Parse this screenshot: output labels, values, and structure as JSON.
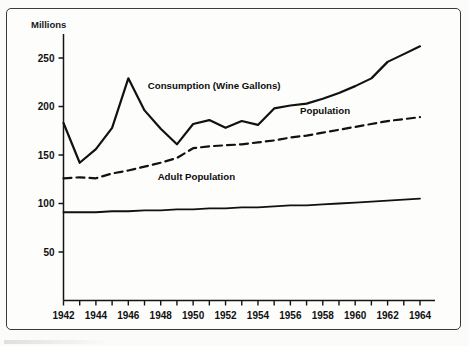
{
  "figure": {
    "frame": true,
    "background_color": "#fdfdfc",
    "ink_color": "#111111"
  },
  "chart_data": {
    "type": "line",
    "title": "",
    "xlabel": "",
    "ylabel": "Millions",
    "ylim": [
      0,
      275
    ],
    "xlim": [
      1942,
      1964
    ],
    "grid": false,
    "legend": "inline-annotations",
    "ytick_labels": [
      "250",
      "200",
      "150",
      "100",
      "50"
    ],
    "ytick_values": [
      250,
      200,
      150,
      100,
      50
    ],
    "xtick_labels": [
      "1942",
      "1944",
      "1946",
      "1948",
      "1950",
      "1952",
      "1954",
      "1956",
      "1958",
      "1960",
      "1962",
      "1964"
    ],
    "xtick_values": [
      1942,
      1944,
      1946,
      1948,
      1950,
      1952,
      1954,
      1956,
      1958,
      1960,
      1962,
      1964
    ],
    "minor_xticks_every": 1,
    "x": [
      1942,
      1943,
      1944,
      1945,
      1946,
      1947,
      1948,
      1949,
      1950,
      1951,
      1952,
      1953,
      1954,
      1955,
      1956,
      1957,
      1958,
      1959,
      1960,
      1961,
      1962,
      1963,
      1964
    ],
    "series": [
      {
        "name": "Consumption (Wine Gallons)",
        "style": "solid",
        "width": 2.2,
        "values": [
          183,
          142,
          156,
          178,
          229,
          196,
          177,
          161,
          182,
          186,
          178,
          185,
          181,
          198,
          201,
          203,
          208,
          214,
          221,
          229,
          246,
          254,
          262
        ]
      },
      {
        "name": "Population",
        "style": "dashed",
        "width": 2.2,
        "values": [
          126,
          127,
          126,
          131,
          134,
          138,
          142,
          147,
          157,
          159,
          160,
          161,
          163,
          165,
          168,
          170,
          173,
          176,
          179,
          182,
          185,
          187,
          189
        ]
      },
      {
        "name": "Adult Population",
        "style": "solid",
        "width": 1.8,
        "values": [
          91,
          91,
          91,
          92,
          92,
          93,
          93,
          94,
          94,
          95,
          95,
          96,
          96,
          97,
          98,
          98,
          99,
          100,
          101,
          102,
          103,
          104,
          105
        ]
      }
    ],
    "annotations": [
      {
        "text": "Consumption (Wine Gallons)",
        "x": 1947.2,
        "y": 218,
        "anchor": "start"
      },
      {
        "text": "Population",
        "x": 1956.6,
        "y": 192,
        "anchor": "start"
      },
      {
        "text": "Adult Population",
        "x": 1950.2,
        "y": 124,
        "anchor": "middle"
      }
    ]
  }
}
